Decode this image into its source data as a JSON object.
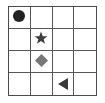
{
  "grid": {
    "rows": 4,
    "cols": 4
  },
  "pieces": [
    {
      "shape": "circle",
      "row": 0,
      "col": 0,
      "color": "#222222"
    },
    {
      "shape": "star",
      "row": 1,
      "col": 1,
      "color": "#3c3c3c"
    },
    {
      "shape": "diamond",
      "row": 2,
      "col": 1,
      "color": "#777777"
    },
    {
      "shape": "triangle-left",
      "row": 3,
      "col": 2,
      "color": "#3a3a3a"
    }
  ]
}
